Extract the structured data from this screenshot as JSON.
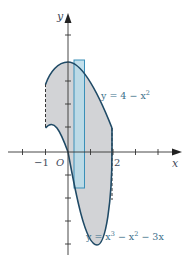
{
  "figure": {
    "axis_labels": {
      "x": "x",
      "y": "y",
      "origin": "O"
    },
    "tick_labels": {
      "neg_one": "−1",
      "two": "2"
    },
    "curves": [
      {
        "name": "upper",
        "label_lhs": "y = 4 − x",
        "label_exp": "2"
      },
      {
        "name": "lower",
        "label_lhs": "y = x",
        "label_exp1": "3",
        "label_mid": " − x",
        "label_exp2": "2",
        "label_rhs": " − 3x"
      }
    ],
    "domain_x": [
      -1,
      2
    ],
    "colors": {
      "curve": "#1f4a66",
      "region_fill": "#d2d3d6",
      "rect_fill": "#b9dbe9",
      "rect_stroke": "#3a8fb7",
      "axis": "#333333",
      "label": "#3a6f8a"
    }
  }
}
